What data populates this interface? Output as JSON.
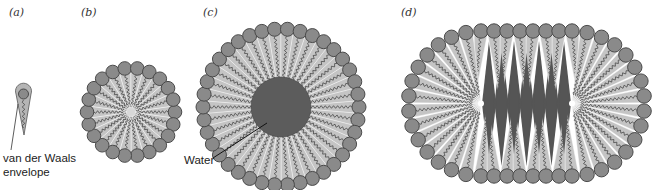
{
  "figure": {
    "panels": [
      {
        "id": "a",
        "label": "(a)",
        "description": "single lipid molecule with van der Waals envelope"
      },
      {
        "id": "b",
        "label": "(b)",
        "description": "spherical micelle"
      },
      {
        "id": "c",
        "label": "(c)",
        "description": "reverse micelle / vesicle with water core"
      },
      {
        "id": "d",
        "label": "(d)",
        "description": "elongated (cylindrical) micelle"
      }
    ],
    "annotations": {
      "van_der_waals_line1": "van der Waals",
      "van_der_waals_line2": "envelope",
      "water": "Water"
    },
    "colors": {
      "head_fill": "#8a8a8a",
      "head_stroke": "#4a4a4a",
      "tail_zone": "#c4c4c4",
      "tail_line": "#3a3a3a",
      "water_core": "#5c5c5c",
      "highlight": "#ffffff"
    }
  }
}
